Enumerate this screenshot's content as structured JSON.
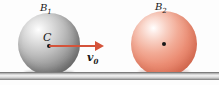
{
  "figure": {
    "type": "physics-diagram",
    "background_color": "#fdfdfd"
  },
  "ground": {
    "name": "horizontal-surface",
    "color_top": "#9a9a9a",
    "color_mid": "#f2f2f2",
    "color_bottom": "#a5a5a5"
  },
  "bodies": [
    {
      "id": "body-1",
      "label_letter": "B",
      "label_subscript": "1",
      "color": "#8f8f8f",
      "center_label": "C",
      "has_center_dot": true
    },
    {
      "id": "body-2",
      "label_letter": "B",
      "label_subscript": "2",
      "color": "#ec8f76",
      "center_label": "",
      "has_center_dot": true
    }
  ],
  "vectors": [
    {
      "id": "velocity-vector",
      "label_letter": "v",
      "label_subscript": "0",
      "color": "#d4533a",
      "direction": "right"
    }
  ]
}
